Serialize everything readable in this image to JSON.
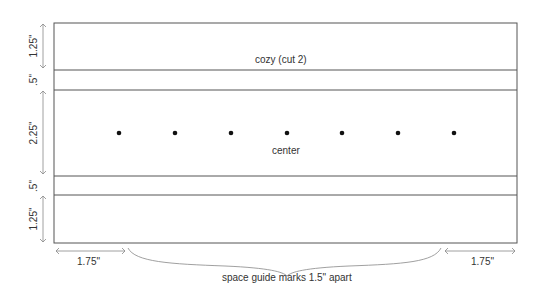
{
  "diagram": {
    "top_label": "cozy (cut 2)",
    "center_label": "center",
    "bottom_label": "space guide marks 1.5\" apart",
    "left_dims": [
      "1.25\"",
      ".5\"",
      "2.25\"",
      ".5\"",
      "1.25\""
    ],
    "left_margin": "1.75\"",
    "right_margin": "1.75\"",
    "guide_marks_count": 7,
    "line_color": "#555555",
    "text_color": "#333333"
  }
}
